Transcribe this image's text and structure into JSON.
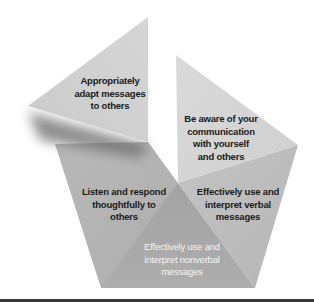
{
  "diagram": {
    "type": "segmented-pentagon",
    "center": [
      178,
      183
    ],
    "segments": [
      {
        "id": "adapt",
        "label": "Appropriately\nadapt messages\nto others",
        "fill": "#d1d1d1",
        "text_color": "#1a1a1a",
        "detached": true
      },
      {
        "id": "aware",
        "label": "Be aware of your\ncommunication\nwith yourself\nand others",
        "fill": "#d6d6d6",
        "text_color": "#1a1a1a"
      },
      {
        "id": "verbal",
        "label": "Effectively use and\ninterpret verbal\nmessages",
        "fill": "#bebebe",
        "text_color": "#1a1a1a"
      },
      {
        "id": "nonverbal",
        "label": "Effectively use and\ninterpret nonverbal\nmessages",
        "fill": "#a9a9a9",
        "text_color": "#f4f4f4"
      },
      {
        "id": "listen",
        "label": "Listen and respond\nthoughtfully to\nothers",
        "fill": "#b4b4b4",
        "text_color": "#1a1a1a"
      }
    ],
    "rule_color": "#3a3a3a"
  }
}
